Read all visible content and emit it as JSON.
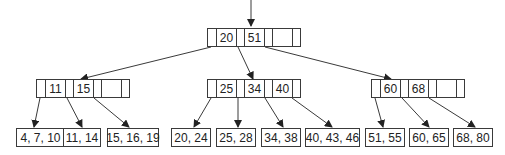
{
  "diagram": {
    "type": "b-tree",
    "colors": {
      "line": "#3a3a3a",
      "text": "#222222",
      "background": "#ffffff"
    },
    "root": {
      "keys": [
        "20",
        "51",
        ""
      ]
    },
    "internal": [
      {
        "keys": [
          "11",
          "15",
          ""
        ]
      },
      {
        "keys": [
          "25",
          "34",
          "40"
        ]
      },
      {
        "keys": [
          "60",
          "68",
          ""
        ]
      }
    ],
    "leaves": [
      {
        "label": "4, 7, 10"
      },
      {
        "label": "11, 14"
      },
      {
        "label": "15, 16, 19"
      },
      {
        "label": "20, 24"
      },
      {
        "label": "25, 28"
      },
      {
        "label": "34, 38"
      },
      {
        "label": "40, 43, 46"
      },
      {
        "label": "51, 55"
      },
      {
        "label": "60, 65"
      },
      {
        "label": "68, 80"
      }
    ]
  }
}
